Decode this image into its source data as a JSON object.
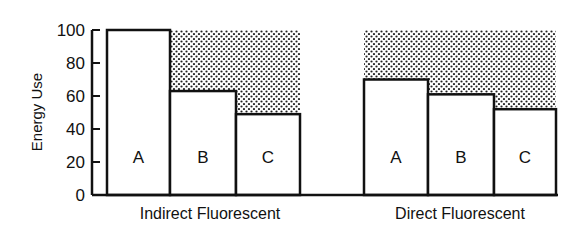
{
  "chart_data": {
    "type": "bar",
    "title": "",
    "xlabel": "",
    "ylabel": "Energy Use",
    "ylim": [
      0,
      100
    ],
    "yticks": [
      0,
      20,
      40,
      60,
      80,
      100
    ],
    "grid": false,
    "legend": null,
    "groups": [
      {
        "name": "Indirect Fluorescent",
        "categories": [
          "A",
          "B",
          "C"
        ],
        "values": [
          100,
          63,
          49
        ],
        "shaded_savings_reference": 100
      },
      {
        "name": "Direct Fluorescent",
        "categories": [
          "A",
          "B",
          "C"
        ],
        "values": [
          70,
          61,
          52
        ],
        "shaded_savings_reference": 100
      }
    ],
    "annotations": [
      "Stippled area above bars shows energy savings relative to 100"
    ]
  },
  "colors": {
    "ink": "#111111",
    "bar_fill": "#ffffff",
    "stipple": "#222222"
  }
}
